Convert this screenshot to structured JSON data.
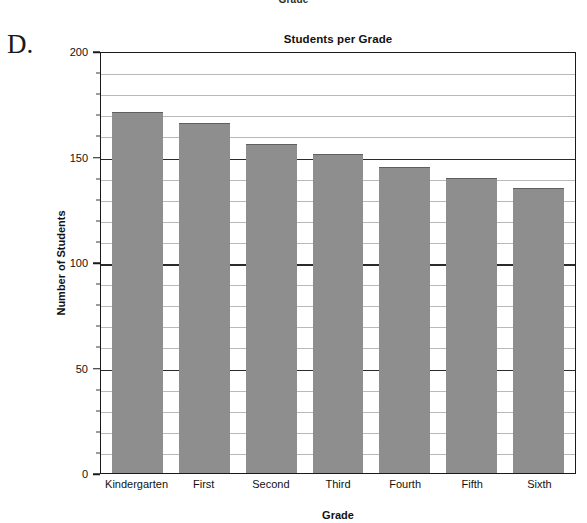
{
  "panel": {
    "letter": "D."
  },
  "cut_off_label_above": "Grade",
  "chart_data": {
    "type": "bar",
    "title": "Students per Grade",
    "xlabel": "Grade",
    "ylabel": "Number of Students",
    "categories": [
      "Kindergarten",
      "First",
      "Second",
      "Third",
      "Fourth",
      "Fifth",
      "Sixth"
    ],
    "values": [
      171,
      166,
      156,
      151,
      145,
      140,
      135
    ],
    "ylim": [
      0,
      200
    ],
    "yticks": [
      0,
      50,
      100,
      150,
      200
    ],
    "ytick_labels": [
      "0",
      "50",
      "100",
      "150",
      "200"
    ],
    "minor_tick_step": 10,
    "grid": true,
    "legend": null,
    "bar_color": "#8e8e8e",
    "axis_color": "#1a1a1a",
    "gridline_color": "#b9b9b9"
  }
}
